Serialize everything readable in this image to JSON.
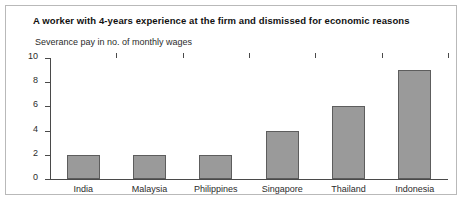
{
  "chart_data": {
    "type": "bar",
    "title": "A worker with 4-years experience at the firm and dismissed for economic reasons",
    "subtitle": "Severance pay in no. of monthly wages",
    "xlabel": "",
    "ylabel": "",
    "categories": [
      "India",
      "Malaysia",
      "Philippines",
      "Singapore",
      "Thailand",
      "Indonesia"
    ],
    "values": [
      2,
      2,
      2,
      4,
      6,
      9
    ],
    "ylim": [
      0,
      10
    ],
    "y_ticks": [
      0,
      2,
      4,
      6,
      8,
      10
    ],
    "grid": false,
    "legend": null,
    "bar_color": "#9a9a9a",
    "bar_border_color": "#5d5d5d",
    "axis_color": "#4a4a4a",
    "frame_color": "#b9b9b9",
    "background": "#ffffff"
  }
}
